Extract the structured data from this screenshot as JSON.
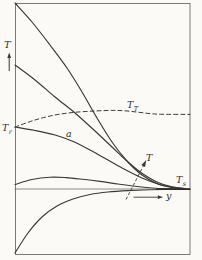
{
  "figure": {
    "kind": "scanned textbook plot, temperature profiles vs wall distance",
    "axes_shown_as": "framed box, no ticks, no numeric scale"
  },
  "colors": {
    "paper": "#fbfaf7",
    "ink": "#383838",
    "thin_line": "#6e6e6e",
    "border": "#7a7a7a"
  },
  "labels": {
    "ordinate": "T",
    "recovery": {
      "main": "T",
      "sub": "r"
    },
    "adiabatic": "a",
    "total": {
      "main": "T",
      "sub": "T"
    },
    "profile_pointer": "T",
    "static_temp": {
      "main": "T",
      "sub": "s"
    },
    "abscissa": "y"
  },
  "chart_data": {
    "type": "line",
    "title": "",
    "xlabel": "y",
    "ylabel": "T",
    "legend": "none",
    "axes_qualitative": true,
    "units": "points are image pixels, y-down; T increases upward, wall at left edge",
    "plot_box_px": {
      "left": 15,
      "top": 3,
      "right": 190,
      "bottom": 254.5
    },
    "reference_levels_px": {
      "T_r": 127,
      "T_T_freestream": 114.5,
      "T_s": 189
    },
    "visible_text_labels": [
      "T",
      "T_r",
      "a",
      "T_T",
      "T",
      "T_s",
      "y"
    ],
    "series": [
      {
        "name": "profile-hot-wall-1",
        "role": "T profile, wall far above T_r",
        "line": "solid",
        "width": 1.15,
        "color": "#383838",
        "points": [
          [
            15,
            3
          ],
          [
            32,
            22
          ],
          [
            50,
            45
          ],
          [
            67,
            68
          ],
          [
            82,
            92
          ],
          [
            97,
            118
          ],
          [
            112,
            142
          ],
          [
            127,
            161
          ],
          [
            142,
            175
          ],
          [
            158,
            184
          ],
          [
            172,
            187.5
          ],
          [
            185,
            188.8
          ]
        ]
      },
      {
        "name": "profile-hot-wall-2",
        "role": "T profile, wall above T_r",
        "line": "solid",
        "width": 1.15,
        "color": "#383838",
        "points": [
          [
            15,
            65
          ],
          [
            35,
            80
          ],
          [
            55,
            97
          ],
          [
            75,
            113
          ],
          [
            95,
            131
          ],
          [
            112,
            147
          ],
          [
            128,
            162
          ],
          [
            143,
            174
          ],
          [
            158,
            182.5
          ],
          [
            172,
            186.8
          ],
          [
            185,
            188.6
          ]
        ]
      },
      {
        "name": "profile-adiabatic-a",
        "role": "adiabatic wall profile a, starts at T_r",
        "line": "solid",
        "width": 1.15,
        "color": "#383838",
        "points": [
          [
            15,
            127
          ],
          [
            35,
            130.5
          ],
          [
            55,
            135
          ],
          [
            72,
            141
          ],
          [
            90,
            150
          ],
          [
            108,
            160
          ],
          [
            125,
            169.5
          ],
          [
            142,
            178
          ],
          [
            158,
            184
          ],
          [
            172,
            187.3
          ],
          [
            185,
            188.6
          ]
        ]
      },
      {
        "name": "profile-overshoot",
        "role": "T profile, T_s < wall < T_r, slight overshoot",
        "line": "solid",
        "width": 1.1,
        "color": "#383838",
        "points": [
          [
            15,
            184.5
          ],
          [
            32,
            179.5
          ],
          [
            50,
            177.2
          ],
          [
            66,
            177.6
          ],
          [
            83,
            179.3
          ],
          [
            100,
            181.4
          ],
          [
            118,
            184
          ],
          [
            135,
            186.3
          ],
          [
            152,
            188
          ],
          [
            168,
            188.8
          ],
          [
            180,
            189
          ]
        ]
      },
      {
        "name": "profile-cold-wall",
        "role": "T profile, wall below T_s",
        "line": "solid",
        "width": 1.15,
        "color": "#383838",
        "points": [
          [
            15,
            253
          ],
          [
            28,
            233
          ],
          [
            42,
            217
          ],
          [
            57,
            206
          ],
          [
            73,
            199
          ],
          [
            90,
            194.5
          ],
          [
            108,
            192
          ],
          [
            128,
            190.6
          ],
          [
            150,
            189.8
          ],
          [
            170,
            189.4
          ],
          [
            190,
            189.2
          ]
        ]
      },
      {
        "name": "total-temperature-dashed",
        "role": "total temperature T_T, dashed",
        "line": "dashed",
        "width": 1.0,
        "color": "#383838",
        "points": [
          [
            15,
            127
          ],
          [
            35,
            120
          ],
          [
            55,
            115
          ],
          [
            75,
            112.3
          ],
          [
            95,
            111
          ],
          [
            112,
            110.4
          ],
          [
            125,
            110.8
          ],
          [
            138,
            112.2
          ],
          [
            150,
            113.6
          ],
          [
            162,
            114.3
          ],
          [
            190,
            114.4
          ]
        ]
      },
      {
        "name": "static-temperature-line",
        "role": "free-stream static temperature T_s level",
        "line": "solid",
        "width": 0.8,
        "color": "#6e6e6e",
        "points": [
          [
            15,
            189
          ],
          [
            190,
            189
          ]
        ]
      },
      {
        "name": "merged-asymptote",
        "role": "profiles merged at T_s near right edge",
        "line": "solid",
        "width": 1.8,
        "color": "#2c2c2c",
        "points": [
          [
            157,
            189.1
          ],
          [
            189.5,
            189.1
          ]
        ]
      }
    ]
  }
}
